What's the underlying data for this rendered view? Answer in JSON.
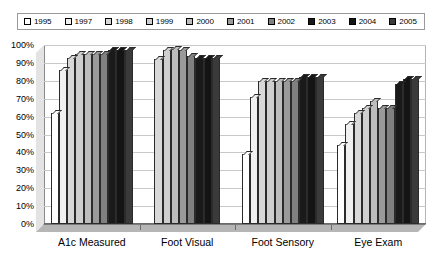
{
  "legend": {
    "position": "top",
    "items": [
      {
        "label": "1995",
        "color": "#ffffff"
      },
      {
        "label": "1997",
        "color": "#f0f0f0"
      },
      {
        "label": "1998",
        "color": "#d8d8d8"
      },
      {
        "label": "1999",
        "color": "#cfcfcf"
      },
      {
        "label": "2000",
        "color": "#bdbdbd"
      },
      {
        "label": "2001",
        "color": "#9a9a9a"
      },
      {
        "label": "2002",
        "color": "#808080"
      },
      {
        "label": "2003",
        "color": "#1a1a1a"
      },
      {
        "label": "2004",
        "color": "#141414"
      },
      {
        "label": "2005",
        "color": "#3a3a3a"
      }
    ]
  },
  "yaxis": {
    "ticks": [
      "100%",
      "90%",
      "80%",
      "70%",
      "60%",
      "50%",
      "40%",
      "30%",
      "20%",
      "10%",
      "0%"
    ]
  },
  "xaxis": {
    "categories": [
      "A1c Measured",
      "Foot Visual",
      "Foot Sensory",
      "Eye Exam"
    ]
  },
  "chart_data": {
    "type": "bar",
    "title": "",
    "subtitle": "",
    "xlabel": "",
    "ylabel": "",
    "ylim": [
      0,
      100
    ],
    "ytick_step": 10,
    "ytick_format": "percent",
    "grid": true,
    "legend_position": "top",
    "style": "3d-clustered-column-grayscale",
    "categories": [
      "A1c Measured",
      "Foot Visual",
      "Foot Sensory",
      "Eye Exam"
    ],
    "series": [
      {
        "name": "1995",
        "color": "#ffffff",
        "values": [
          62,
          null,
          39,
          44
        ]
      },
      {
        "name": "1997",
        "color": "#f0f0f0",
        "values": [
          86,
          null,
          71,
          56
        ]
      },
      {
        "name": "1998",
        "color": "#d8d8d8",
        "values": [
          93,
          92,
          80,
          62
        ]
      },
      {
        "name": "1999",
        "color": "#cfcfcf",
        "values": [
          95,
          97,
          80,
          65
        ]
      },
      {
        "name": "2000",
        "color": "#bdbdbd",
        "values": [
          95,
          98,
          80,
          69
        ]
      },
      {
        "name": "2001",
        "color": "#9a9a9a",
        "values": [
          95,
          97,
          80,
          65
        ]
      },
      {
        "name": "2002",
        "color": "#808080",
        "values": [
          95,
          94,
          80,
          65
        ]
      },
      {
        "name": "2003",
        "color": "#1a1a1a",
        "values": [
          97,
          93,
          82,
          78
        ]
      },
      {
        "name": "2004",
        "color": "#141414",
        "values": [
          97,
          93,
          82,
          81
        ]
      },
      {
        "name": "2005",
        "color": "#3a3a3a",
        "values": [
          97,
          93,
          82,
          81
        ]
      }
    ]
  }
}
